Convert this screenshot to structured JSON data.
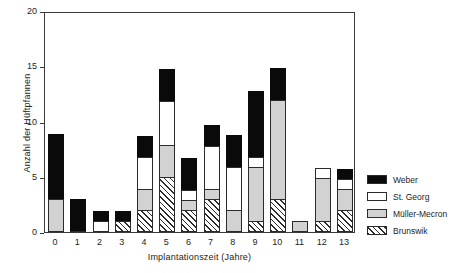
{
  "chart_data": {
    "type": "bar",
    "title": "",
    "subtitle": "",
    "stacked": true,
    "xlabel": "Implantationszeit (Jahre)",
    "ylabel": "Anzahl der Hüftpfannen",
    "categories": [
      "0",
      "1",
      "2",
      "3",
      "4",
      "5",
      "6",
      "7",
      "8",
      "9",
      "10",
      "11",
      "12",
      "13"
    ],
    "ylim": [
      0,
      20
    ],
    "yticks": [
      "0",
      "5",
      "10",
      "15",
      "20"
    ],
    "ytick_values": [
      0,
      5,
      10,
      15,
      20
    ],
    "grid": false,
    "legend_position": "right",
    "series": [
      {
        "name": "Brunswik",
        "color": "#ffffff",
        "pattern": "hatched",
        "values": [
          0,
          0,
          0,
          1,
          2,
          5,
          2,
          3,
          0,
          1,
          3,
          0,
          1,
          2
        ]
      },
      {
        "name": "Müller-Mecron",
        "color": "#d2d2d2",
        "pattern": "solid",
        "values": [
          3,
          0,
          0,
          0,
          2,
          3,
          1,
          1,
          2,
          5,
          9,
          1,
          4,
          2
        ]
      },
      {
        "name": "St. Georg",
        "color": "#ffffff",
        "pattern": "solid",
        "values": [
          0,
          0,
          1,
          0,
          3,
          4,
          1,
          4,
          4,
          1,
          0,
          0,
          1,
          1
        ]
      },
      {
        "name": "Weber",
        "color": "#0a0a0a",
        "pattern": "solid",
        "values": [
          6,
          3,
          1,
          1,
          2,
          3,
          3,
          2,
          3,
          6,
          3,
          0,
          0,
          1
        ]
      }
    ],
    "totals": [
      9,
      3,
      2,
      2,
      9,
      15,
      7,
      10,
      9,
      13,
      15,
      1,
      6,
      6
    ]
  },
  "legend": {
    "items": [
      {
        "label": "Weber",
        "swatch": "legend-swatch-weber"
      },
      {
        "label": "St. Georg",
        "swatch": "legend-swatch-st-georg"
      },
      {
        "label": "Müller-Mecron",
        "swatch": "legend-swatch-mueller-mecron"
      },
      {
        "label": "Brunswik",
        "swatch": "legend-swatch-brunswik"
      }
    ]
  }
}
